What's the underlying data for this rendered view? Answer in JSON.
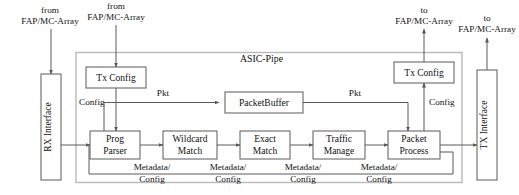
{
  "diagram": {
    "region_label": "ASIC-Pipe",
    "colors": {
      "background": "#ffffff",
      "box_stroke": "#5a5a5a",
      "outer_stroke": "#b9b9b9",
      "wire": "#5a5a5a",
      "text": "#111111"
    }
  },
  "external_ports": {
    "rx_config_source": {
      "line1": "from",
      "line2": "FAP/MC-Array"
    },
    "tx_config_source": {
      "line1": "from",
      "line2": "FAP/MC-Array"
    },
    "tx_config_sink": {
      "line1": "to",
      "line2": "FAP/MC-Array"
    },
    "tx_interface_sink": {
      "line1": "to",
      "line2": "FAP/MC-Array"
    }
  },
  "interfaces": {
    "rx": "RX Interface",
    "tx": "TX Interface"
  },
  "config_blocks": {
    "left": "Tx Config",
    "right": "Tx Config"
  },
  "buffer": {
    "label": "PacketBuffer"
  },
  "pipeline_stages": [
    {
      "id": "prog-parser",
      "line1": "Prog",
      "line2": "Parser"
    },
    {
      "id": "wildcard-match",
      "line1": "Wildcard",
      "line2": "Match"
    },
    {
      "id": "exact-match",
      "line1": "Exact",
      "line2": "Match"
    },
    {
      "id": "traffic-manage",
      "line1": "Traffic",
      "line2": "Manage"
    },
    {
      "id": "packet-process",
      "line1": "Packet",
      "line2": "Process"
    }
  ],
  "edge_labels": {
    "pkt_in": "Pkt",
    "pkt_out": "Pkt",
    "config_left": "Config",
    "config_right": "Config",
    "metadata": [
      {
        "line1": "Metadata/",
        "line2": "Config"
      },
      {
        "line1": "Metadata/",
        "line2": "Config"
      },
      {
        "line1": "Metadata/",
        "line2": "Config"
      },
      {
        "line1": "Metadata/",
        "line2": "Config"
      }
    ]
  }
}
